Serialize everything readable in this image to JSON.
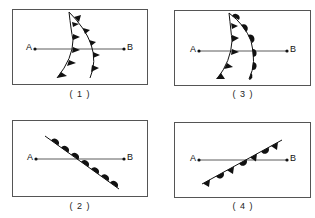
{
  "panels": [
    {
      "id": "1",
      "caption": "( 1 )",
      "point_a": "A",
      "point_b": "B",
      "front": "two cold fronts (triangles) curving"
    },
    {
      "id": "2",
      "caption": "( 2 )",
      "point_a": "A",
      "point_b": "B",
      "front": "warm front (semicircles) descending diagonal"
    },
    {
      "id": "3",
      "caption": "( 3 )",
      "point_a": "A",
      "point_b": "B",
      "front": "cold front (triangles) and warm front (semicircles) curving"
    },
    {
      "id": "4",
      "caption": "( 4 )",
      "point_a": "A",
      "point_b": "B",
      "front": "occluded front (alternating triangles and semicircles) ascending diagonal"
    }
  ],
  "colors": {
    "line": "#222222",
    "border": "#555555",
    "background": "#ffffff"
  }
}
